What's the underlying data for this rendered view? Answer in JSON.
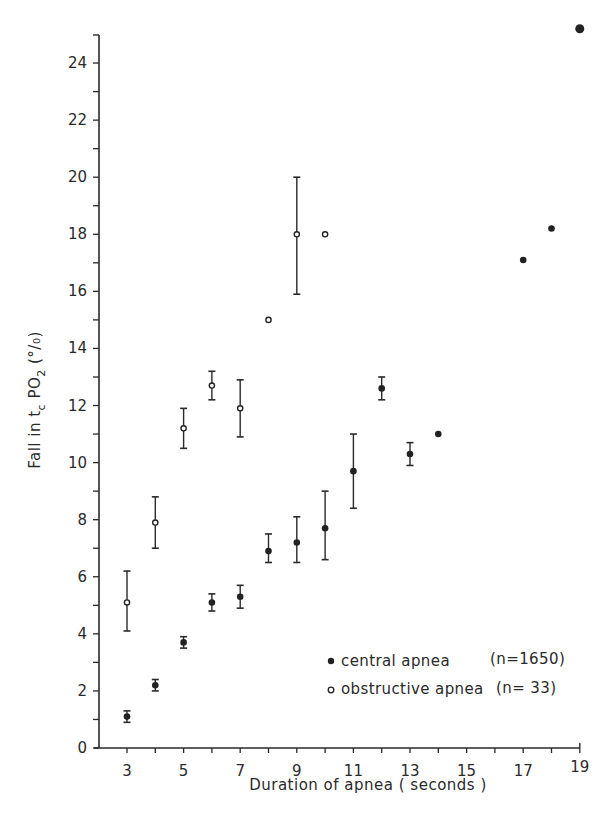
{
  "chart_data": {
    "type": "scatter",
    "title": "",
    "xlabel": "Duration of apnea ( seconds )",
    "ylabel": "Fall in tc PO2 (%)",
    "ylabel_parts": {
      "main": "Fall in t",
      "sub": "c",
      "mid": " PO",
      "sub2": "2",
      "tail": " (%)"
    },
    "xlim": [
      2,
      19
    ],
    "ylim": [
      0,
      25
    ],
    "x_ticks": [
      3,
      5,
      7,
      9,
      11,
      13,
      15,
      17,
      19
    ],
    "x_minor_ticks": [
      4,
      6,
      8,
      10,
      12,
      14,
      16,
      18
    ],
    "y_ticks": [
      0,
      2,
      4,
      6,
      8,
      10,
      12,
      14,
      16,
      18,
      20,
      22,
      24
    ],
    "y_minor_ticks": [
      1,
      3,
      5,
      7,
      9,
      11,
      13,
      15,
      17,
      19,
      21,
      23
    ],
    "grid": false,
    "legend_position": "lower right",
    "series": [
      {
        "name": "central apnea",
        "n_label": "(n=1650)",
        "marker": "filled-circle",
        "points": [
          {
            "x": 3,
            "y": 1.1,
            "err_low": 0.9,
            "err_high": 1.3
          },
          {
            "x": 4,
            "y": 2.2,
            "err_low": 2.0,
            "err_high": 2.4
          },
          {
            "x": 5,
            "y": 3.7,
            "err_low": 3.5,
            "err_high": 3.9
          },
          {
            "x": 6,
            "y": 5.1,
            "err_low": 4.8,
            "err_high": 5.4
          },
          {
            "x": 7,
            "y": 5.3,
            "err_low": 4.9,
            "err_high": 5.7
          },
          {
            "x": 8,
            "y": 6.9,
            "err_low": 6.5,
            "err_high": 7.5
          },
          {
            "x": 9,
            "y": 7.2,
            "err_low": 6.5,
            "err_high": 8.1
          },
          {
            "x": 10,
            "y": 7.7,
            "err_low": 6.6,
            "err_high": 9.0
          },
          {
            "x": 11,
            "y": 9.7,
            "err_low": 8.4,
            "err_high": 11.0
          },
          {
            "x": 12,
            "y": 12.6,
            "err_low": 12.2,
            "err_high": 13.0
          },
          {
            "x": 13,
            "y": 10.3,
            "err_low": 9.9,
            "err_high": 10.7
          },
          {
            "x": 14,
            "y": 11.0,
            "err_low": null,
            "err_high": null
          },
          {
            "x": 17,
            "y": 17.1,
            "err_low": null,
            "err_high": null
          },
          {
            "x": 18,
            "y": 18.2,
            "err_low": null,
            "err_high": null
          },
          {
            "x": 19,
            "y": 25.2,
            "err_low": null,
            "err_high": null
          }
        ]
      },
      {
        "name": "obstructive apnea",
        "n_label": "(n= 33)",
        "marker": "open-circle",
        "points": [
          {
            "x": 3,
            "y": 5.1,
            "err_low": 4.1,
            "err_high": 6.2
          },
          {
            "x": 4,
            "y": 7.9,
            "err_low": 7.0,
            "err_high": 8.8
          },
          {
            "x": 5,
            "y": 11.2,
            "err_low": 10.5,
            "err_high": 11.9
          },
          {
            "x": 6,
            "y": 12.7,
            "err_low": 12.2,
            "err_high": 13.2
          },
          {
            "x": 7,
            "y": 11.9,
            "err_low": 10.9,
            "err_high": 12.9
          },
          {
            "x": 8,
            "y": 15.0,
            "err_low": null,
            "err_high": null
          },
          {
            "x": 9,
            "y": 18.0,
            "err_low": 15.9,
            "err_high": 20.0
          },
          {
            "x": 10,
            "y": 18.0,
            "err_low": null,
            "err_high": null
          }
        ]
      }
    ]
  },
  "legend": {
    "central_label": "central apnea",
    "central_n": "(n=1650)",
    "obstructive_label": "obstructive apnea",
    "obstructive_n": "(n= 33)"
  },
  "axes": {
    "xlabel": "Duration of apnea ( seconds )",
    "ylabel_main": "Fall in t",
    "ylabel_sub": "c",
    "ylabel_mid": " PO",
    "ylabel_sub2": "2",
    "ylabel_tail": " (°/₀)"
  }
}
